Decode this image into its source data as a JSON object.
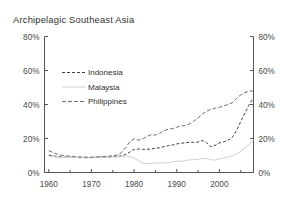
{
  "figure": {
    "cropped_header_fragment": "",
    "background_color": "#ffffff"
  },
  "chart_data": {
    "type": "line",
    "title": "Archipelagic Southeast Asia",
    "xlabel": "",
    "ylabel": "",
    "xlim": [
      1959,
      2008
    ],
    "ylim": [
      0,
      80
    ],
    "ytick_labels_left": [
      "0%",
      "20%",
      "40%",
      "60%",
      "80%"
    ],
    "ytick_labels_right": [
      "0%",
      "20%",
      "40%",
      "60%",
      "80%"
    ],
    "ytick_values": [
      0,
      20,
      40,
      60,
      80
    ],
    "xtick_labels": [
      "1960",
      "1970",
      "1980",
      "1990",
      "2000"
    ],
    "xtick_values": [
      1960,
      1970,
      1980,
      1990,
      2000
    ],
    "minor_xtick_values": [
      1965,
      1975,
      1985,
      1995,
      2005
    ],
    "grid": false,
    "legend_position": "upper-left-inside",
    "y_unit": "percent",
    "dual_y_axis": true,
    "series": [
      {
        "name": "Indonesia",
        "color": "#3f3f3f",
        "dash": "3,2",
        "width": 1.0,
        "x": [
          1960,
          1961,
          1962,
          1963,
          1964,
          1965,
          1966,
          1967,
          1968,
          1969,
          1970,
          1971,
          1972,
          1973,
          1974,
          1975,
          1976,
          1977,
          1978,
          1979,
          1980,
          1981,
          1982,
          1983,
          1984,
          1985,
          1986,
          1987,
          1988,
          1989,
          1990,
          1991,
          1992,
          1993,
          1994,
          1995,
          1996,
          1997,
          1998,
          1999,
          2000,
          2001,
          2002,
          2003,
          2004,
          2005,
          2006,
          2007,
          2008
        ],
        "values": [
          10.2,
          9.8,
          9.4,
          9.2,
          9.0,
          9.0,
          8.9,
          8.8,
          8.8,
          8.8,
          8.8,
          8.9,
          9.0,
          9.1,
          9.2,
          9.3,
          9.4,
          9.8,
          10.6,
          12.0,
          13.6,
          13.8,
          13.6,
          13.6,
          13.8,
          14.2,
          14.6,
          15.2,
          15.8,
          16.2,
          16.8,
          17.2,
          17.5,
          17.8,
          17.8,
          17.9,
          18.8,
          17.6,
          15.2,
          16.0,
          17.4,
          18.0,
          19.0,
          20.6,
          24.5,
          30.0,
          35.0,
          40.0,
          44.0
        ]
      },
      {
        "name": "Malaysia",
        "color": "#cfcfcf",
        "dash": "0",
        "width": 1.0,
        "x": [
          1960,
          1961,
          1962,
          1963,
          1964,
          1965,
          1966,
          1967,
          1968,
          1969,
          1970,
          1971,
          1972,
          1973,
          1974,
          1975,
          1976,
          1977,
          1978,
          1979,
          1980,
          1981,
          1982,
          1983,
          1984,
          1985,
          1986,
          1987,
          1988,
          1989,
          1990,
          1991,
          1992,
          1993,
          1994,
          1995,
          1996,
          1997,
          1998,
          1999,
          2000,
          2001,
          2002,
          2003,
          2004,
          2005,
          2006,
          2007,
          2008
        ],
        "values": [
          9.6,
          9.3,
          9.0,
          8.9,
          8.8,
          8.8,
          8.8,
          8.7,
          8.7,
          8.7,
          8.7,
          8.8,
          8.8,
          8.9,
          9.0,
          9.1,
          9.2,
          9.4,
          9.6,
          9.4,
          8.4,
          7.0,
          5.6,
          5.2,
          5.4,
          5.6,
          5.6,
          5.6,
          5.8,
          6.2,
          6.6,
          6.6,
          7.0,
          7.4,
          7.6,
          7.8,
          8.2,
          8.2,
          7.4,
          7.4,
          8.0,
          8.4,
          9.0,
          9.8,
          10.8,
          12.4,
          14.4,
          16.6,
          19.0
        ]
      },
      {
        "name": "Philippines",
        "color": "#6e6e6e",
        "dash": "4,2",
        "width": 1.0,
        "x": [
          1960,
          1961,
          1962,
          1963,
          1964,
          1965,
          1966,
          1967,
          1968,
          1969,
          1970,
          1971,
          1972,
          1973,
          1974,
          1975,
          1976,
          1977,
          1978,
          1979,
          1980,
          1981,
          1982,
          1983,
          1984,
          1985,
          1986,
          1987,
          1988,
          1989,
          1990,
          1991,
          1992,
          1993,
          1994,
          1995,
          1996,
          1997,
          1998,
          1999,
          2000,
          2001,
          2002,
          2003,
          2004,
          2005,
          2006,
          2007,
          2008
        ],
        "values": [
          12.8,
          11.8,
          10.8,
          10.2,
          9.8,
          9.6,
          9.4,
          9.2,
          9.1,
          9.0,
          9.0,
          9.1,
          9.2,
          9.4,
          9.6,
          9.8,
          10.2,
          11.6,
          14.6,
          18.0,
          19.8,
          19.0,
          19.6,
          21.2,
          22.2,
          22.0,
          23.0,
          24.6,
          25.4,
          25.8,
          26.6,
          27.4,
          27.6,
          28.6,
          30.2,
          32.0,
          34.4,
          36.0,
          37.2,
          37.8,
          38.4,
          39.2,
          40.0,
          41.0,
          43.6,
          45.6,
          47.0,
          47.8,
          48.0
        ]
      }
    ]
  },
  "legend": {
    "items": [
      {
        "label": "Indonesia"
      },
      {
        "label": "Malaysia"
      },
      {
        "label": "Philippines"
      }
    ]
  }
}
